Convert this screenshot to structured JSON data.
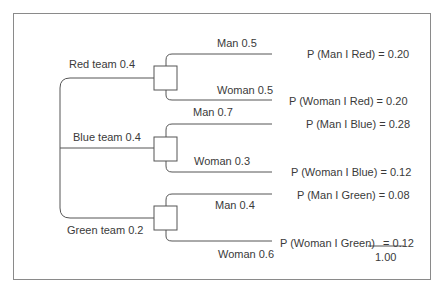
{
  "diagram": {
    "type": "probability-tree",
    "teams": [
      {
        "label": "Red team 0.4",
        "branches": [
          {
            "label": "Man 0.5",
            "result": "P (Man I Red) = 0.20"
          },
          {
            "label": "Woman 0.5",
            "result": "P (Woman I Red)  = 0.20"
          }
        ]
      },
      {
        "label": "Blue team 0.4",
        "branches": [
          {
            "label": "Man 0.7",
            "result": "P (Man I Blue) = 0.28"
          },
          {
            "label": "Woman 0.3",
            "result": "P (Woman I Blue) = 0.12"
          }
        ]
      },
      {
        "label": "Green team 0.2",
        "branches": [
          {
            "label": "Man 0.4",
            "result": "P (Man I Green) = 0.08"
          },
          {
            "label": "Woman 0.6",
            "result_prefix": "P (Woman I Green)",
            "result_eq": "=",
            "result_value": "0.12"
          }
        ]
      }
    ],
    "total": "1.00",
    "line_color": "#555555"
  }
}
